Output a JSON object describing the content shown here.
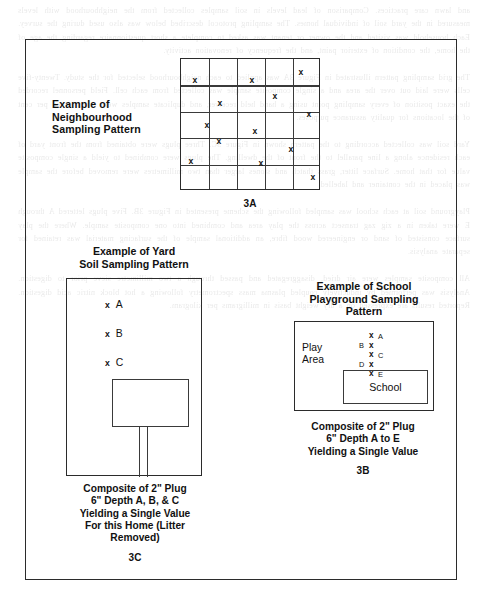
{
  "page": {
    "background_ghost_text": "and lawn care practices. Comparison of lead levels in soil samples collected from the neighbourhood with levels measured in the yard soil of individual homes. The sampling protocol described below was also used during the survey. Each household was visited and the owner or tenant was asked to complete a short questionnaire regarding the age of the home, the condition of exterior paint, and the frequency of renovation activity.\n\nThe grid sampling pattern illustrated in Figure 3A was applied to each neighbourhood selected for the study. Twenty-five cells were laid out over the area and a single composite sample was collected from each cell. Field personnel recorded the exact position of every sampling point using a hand held receiver, and duplicate samples were taken at ten per cent of the locations for quality assurance purposes.\n\nYard soil was collected according to the pattern shown in Figure 3C. Three plugs were obtained from the front yard of each residence along a line parallel to the front of the dwelling. The plugs were combined to yield a single composite value for that home. Surface litter, grass thatch and stones larger than two millimetres were removed before the sample was placed in the container and labelled.\n\nPlayground soil at each school was sampled following the scheme presented in Figure 3B. Five plugs lettered A through E were taken in a zig zag transect across the play area and combined into one composite sample. Where the play surface consisted of sand or engineered wood fibre, an additional sample of the surfacing material was retained for separate analysis.\n\nAll composite samples were air dried, disaggregated and passed through a two millimetre sieve prior to digestion. Analysis was performed by inductively coupled plasma mass spectrometry following a hot block nitric acid digestion. Reported results are expressed on a dry weight basis in milligrams per kilogram."
  },
  "figure": {
    "sections": {
      "neighbourhood": {
        "title": "Example of\nNeighbourhood\nSampling Pattern",
        "title_lines": [
          "Example of",
          "Neighbourhood",
          "Sampling Pattern"
        ],
        "figure_number": "3A",
        "grid": {
          "columns": 5,
          "rows": 5,
          "sample_marker": "x",
          "points": [
            {
              "col": 0,
              "row": 0,
              "cx": 14,
              "cy": 21
            },
            {
              "col": 2,
              "row": 0,
              "cx": 71,
              "cy": 21
            },
            {
              "col": 4,
              "row": 0,
              "cx": 120,
              "cy": 13
            },
            {
              "col": 1,
              "row": 1,
              "cx": 39,
              "cy": 44
            },
            {
              "col": 3,
              "row": 1,
              "cx": 94,
              "cy": 37
            },
            {
              "col": 4,
              "row": 2,
              "cx": 128,
              "cy": 55
            },
            {
              "col": 0,
              "row": 2,
              "cx": 26,
              "cy": 66
            },
            {
              "col": 2,
              "row": 2,
              "cx": 74,
              "cy": 72
            },
            {
              "col": 1,
              "row": 3,
              "cx": 38,
              "cy": 82
            },
            {
              "col": 3,
              "row": 3,
              "cx": 110,
              "cy": 90
            },
            {
              "col": 0,
              "row": 4,
              "cx": 10,
              "cy": 102
            },
            {
              "col": 2,
              "row": 4,
              "cx": 80,
              "cy": 104
            },
            {
              "col": 4,
              "row": 4,
              "cx": 132,
              "cy": 118
            }
          ]
        }
      },
      "yard": {
        "title_lines": [
          "Example of Yard",
          "Soil Sampling Pattern"
        ],
        "figure_number": "3C",
        "sample_points": [
          {
            "marker": "x",
            "label": "A"
          },
          {
            "marker": "x",
            "label": "B"
          },
          {
            "marker": "x",
            "label": "C"
          }
        ],
        "caption_lines": [
          "Composite of 2\" Plug",
          "6\" Depth A, B, & C",
          "Yielding a Single Value",
          "For this Home (Litter",
          "Removed)"
        ]
      },
      "school": {
        "title_lines": [
          "Example of School",
          "Playground Sampling",
          "Pattern"
        ],
        "figure_number": "3B",
        "play_area_label_lines": [
          "Play",
          "Area"
        ],
        "building_label": "School",
        "sample_points": [
          {
            "label": "A",
            "label_side": "right",
            "marker": "x"
          },
          {
            "label": "B",
            "label_side": "left",
            "marker": "x"
          },
          {
            "label": "C",
            "label_side": "right",
            "marker": "x"
          },
          {
            "label": "D",
            "label_side": "left",
            "marker": "x"
          },
          {
            "label": "E",
            "label_side": "right",
            "marker": "x"
          }
        ],
        "caption_lines": [
          "Composite of 2\" Plug",
          "6\" Depth A to E",
          "Yielding a Single Value"
        ]
      }
    },
    "colors": {
      "ink": "#1a1a1a",
      "rule": "#2b2b2b",
      "paper": "#ffffff"
    }
  }
}
